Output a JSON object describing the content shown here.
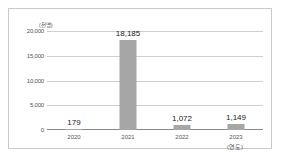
{
  "chart_data": {
    "type": "bar",
    "title": "",
    "xlabel": "",
    "ylabel": "",
    "unit_label": "(천명)",
    "axis_note": "(연도)",
    "categories": [
      "2020",
      "2021",
      "2022",
      "2023"
    ],
    "values": [
      179,
      18185,
      1072,
      1149
    ],
    "value_labels": [
      "179",
      "18,185",
      "1,072",
      "1,149"
    ],
    "ylim": [
      0,
      20000
    ],
    "yticks": [
      0,
      5000,
      10000,
      15000,
      20000
    ],
    "ytick_labels": [
      "0",
      "5,000",
      "10,000",
      "15,000",
      "20,000"
    ],
    "grid": true,
    "legend": false,
    "bar_color": "#a6a6a6",
    "gridline_color": "#cfcfcf",
    "axis_color": "#8a8a8a",
    "frame_color": "#c9c9c9"
  }
}
